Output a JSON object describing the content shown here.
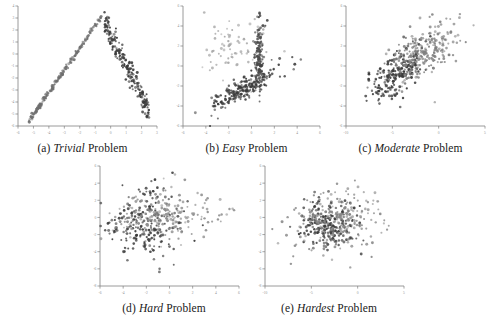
{
  "figure": {
    "type": "scatter-matrix",
    "background": "#ffffff",
    "panel_count": 5
  },
  "panels": [
    {
      "id": "a",
      "label_prefix": "(a)",
      "emphasis": "Trivial",
      "suffix": "Problem",
      "caption_full": "(a) Trivial Problem",
      "xlim": [
        -6,
        3
      ],
      "ylim": [
        -6,
        4
      ],
      "xticks": [
        -6,
        -5,
        -4,
        -3,
        -2,
        -1,
        0,
        1,
        2,
        3
      ],
      "yticks": [
        -6,
        -5,
        -4,
        -3,
        -2,
        -1,
        0,
        1,
        2,
        3,
        4
      ],
      "xticklabels": [
        "-6",
        "-5",
        "-4",
        "-3",
        "-2",
        "-1",
        "0",
        "1",
        "2",
        "3"
      ],
      "yticklabels": [
        "-6",
        "-5",
        "-4",
        "-3",
        "-2",
        "-1",
        "0",
        "1",
        "2",
        "3",
        "4"
      ]
    },
    {
      "id": "b",
      "label_prefix": "(b)",
      "emphasis": "Easy",
      "suffix": "Problem",
      "caption_full": "(b) Easy Problem",
      "xlim": [
        -6,
        6
      ],
      "ylim": [
        -6,
        6
      ],
      "xticks": [
        -6,
        -4,
        -2,
        0,
        2,
        4,
        6
      ],
      "yticks": [
        -6,
        -4,
        -2,
        0,
        2,
        4,
        6
      ],
      "xticklabels": [
        "-6",
        "-4",
        "-2",
        "0",
        "2",
        "4",
        "6"
      ],
      "yticklabels": [
        "-6",
        "-4",
        "-2",
        "0",
        "2",
        "4",
        "6"
      ]
    },
    {
      "id": "c",
      "label_prefix": "(c)",
      "emphasis": "Moderate",
      "suffix": "Problem",
      "caption_full": "(c) Moderate Problem",
      "xlim": [
        -10,
        5
      ],
      "ylim": [
        -6,
        6
      ],
      "xticks": [
        -10,
        -5,
        0,
        5
      ],
      "yticks": [
        -6,
        -4,
        -2,
        0,
        2,
        4,
        6
      ],
      "xticklabels": [
        "-10",
        "-5",
        "0",
        "5"
      ],
      "yticklabels": [
        "-6",
        "-4",
        "-2",
        "0",
        "2",
        "4",
        "6"
      ]
    },
    {
      "id": "d",
      "label_prefix": "(d)",
      "emphasis": "Hard",
      "suffix": "Problem",
      "caption_full": "(d) Hard Problem",
      "xlim": [
        -6,
        6
      ],
      "ylim": [
        -8,
        6
      ],
      "xticks": [
        -6,
        -4,
        -2,
        0,
        2,
        4,
        6
      ],
      "yticks": [
        -8,
        -6,
        -4,
        -2,
        0,
        2,
        4,
        6
      ],
      "xticklabels": [
        "-6",
        "-4",
        "-2",
        "0",
        "2",
        "4",
        "6"
      ],
      "yticklabels": [
        "-8",
        "-6",
        "-4",
        "-2",
        "0",
        "2",
        "4",
        "6"
      ]
    },
    {
      "id": "e",
      "label_prefix": "(e)",
      "emphasis": "Hardest",
      "suffix": "Problem",
      "caption_full": "(e) Hardest Problem",
      "xlim": [
        -10,
        5
      ],
      "ylim": [
        -8,
        6
      ],
      "xticks": [
        -10,
        -5,
        0,
        5
      ],
      "yticks": [
        -8,
        -6,
        -4,
        -2,
        0,
        2,
        4,
        6
      ],
      "xticklabels": [
        "-10",
        "-5",
        "0",
        "5"
      ],
      "yticklabels": [
        "-8",
        "-6",
        "-4",
        "-2",
        "0",
        "2",
        "4",
        "6"
      ]
    }
  ],
  "colors": {
    "cluster_dark": "#3a3a3a",
    "cluster_mid": "#6e6e6e",
    "cluster_light": "#a8a8a8",
    "axis": "#808080",
    "text": "#1a1a1a",
    "tick_text": "#909090"
  },
  "chart_data": [
    {
      "type": "scatter",
      "panel": "a",
      "title": "(a) Trivial Problem",
      "xlabel": "",
      "ylabel": "",
      "xlim": [
        -6,
        3
      ],
      "ylim": [
        -6,
        4
      ],
      "grid": false,
      "legend": "none",
      "series": [
        {
          "name": "cluster-1",
          "color": "#6e6e6e",
          "n": 180,
          "shape": "line-diagonal-positive",
          "x_range": [
            -5.3,
            -0.6
          ],
          "y_range": [
            -5.6,
            3.1
          ],
          "slope": 1.85,
          "intercept": 4.2,
          "spread": 0.11,
          "seed": 11
        },
        {
          "name": "cluster-2",
          "color": "#3a3a3a",
          "n": 200,
          "shape": "line-diagonal-negative",
          "x_range": [
            -0.4,
            2.5
          ],
          "y_range": [
            -5.6,
            3.0
          ],
          "slope": -2.6,
          "intercept": 1.6,
          "spread": 0.55,
          "seed": 23
        }
      ]
    },
    {
      "type": "scatter",
      "panel": "b",
      "title": "(b) Easy Problem",
      "xlabel": "",
      "ylabel": "",
      "xlim": [
        -6,
        6
      ],
      "ylim": [
        -6,
        6
      ],
      "grid": false,
      "legend": "none",
      "series": [
        {
          "name": "cluster-1",
          "color": "#a8a8a8",
          "n": 70,
          "shape": "diffuse-cloud",
          "cx": -1.8,
          "cy": 1.6,
          "sx": 1.5,
          "sy": 1.7,
          "rho": 0.1,
          "seed": 31
        },
        {
          "name": "cluster-2",
          "color": "#4a4a4a",
          "n": 140,
          "shape": "vertical-spine",
          "cx": 0.7,
          "cy": 1.0,
          "sx": 0.22,
          "sy": 1.9,
          "rho": 0.0,
          "seed": 37
        },
        {
          "name": "cluster-3",
          "color": "#3a3a3a",
          "n": 190,
          "shape": "diagonal-band",
          "cx": -0.6,
          "cy": -2.2,
          "sx": 1.5,
          "sy": 1.1,
          "rho": 0.86,
          "seed": 41
        }
      ]
    },
    {
      "type": "scatter",
      "panel": "c",
      "title": "(c) Moderate Problem",
      "xlabel": "",
      "ylabel": "",
      "xlim": [
        -10,
        5
      ],
      "ylim": [
        -6,
        6
      ],
      "grid": false,
      "legend": "none",
      "series": [
        {
          "name": "cluster-1",
          "color": "#3a3a3a",
          "n": 230,
          "shape": "elongated-diagonal",
          "cx": -4.3,
          "cy": -0.7,
          "sx": 1.5,
          "sy": 1.3,
          "rho": 0.62,
          "seed": 53
        },
        {
          "name": "cluster-2",
          "color": "#808080",
          "n": 230,
          "shape": "elongated-diagonal",
          "cx": -1.6,
          "cy": 1.4,
          "sx": 2.0,
          "sy": 1.6,
          "rho": 0.6,
          "seed": 59
        }
      ]
    },
    {
      "type": "scatter",
      "panel": "d",
      "title": "(d) Hard Problem",
      "xlabel": "",
      "ylabel": "",
      "xlim": [
        -6,
        6
      ],
      "ylim": [
        -8,
        6
      ],
      "grid": false,
      "legend": "none",
      "series": [
        {
          "name": "cluster-1",
          "color": "#3a3a3a",
          "n": 230,
          "shape": "blob",
          "cx": -1.9,
          "cy": -0.7,
          "sx": 1.5,
          "sy": 2.1,
          "rho": 0.12,
          "seed": 67
        },
        {
          "name": "cluster-2",
          "color": "#909090",
          "n": 180,
          "shape": "horizontal-tail",
          "cx": -0.5,
          "cy": 0.4,
          "sx": 2.2,
          "sy": 1.6,
          "rho": 0.2,
          "seed": 71
        }
      ]
    },
    {
      "type": "scatter",
      "panel": "e",
      "title": "(e) Hardest Problem",
      "xlabel": "",
      "ylabel": "",
      "xlim": [
        -10,
        5
      ],
      "ylim": [
        -8,
        6
      ],
      "grid": false,
      "legend": "none",
      "series": [
        {
          "name": "cluster-1",
          "color": "#3a3a3a",
          "n": 240,
          "shape": "blob",
          "cx": -3.0,
          "cy": -1.0,
          "sx": 1.5,
          "sy": 1.4,
          "rho": 0.05,
          "seed": 83
        },
        {
          "name": "cluster-2",
          "color": "#8a8a8a",
          "n": 210,
          "shape": "blob",
          "cx": -2.0,
          "cy": -0.3,
          "sx": 2.3,
          "sy": 1.8,
          "rho": 0.1,
          "seed": 89
        }
      ]
    }
  ]
}
